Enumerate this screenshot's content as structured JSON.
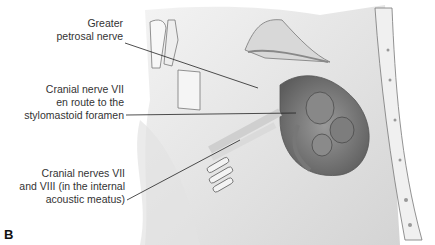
{
  "figure": {
    "panel_label": "B",
    "labels": [
      {
        "id": "greater-petrosal",
        "lines": [
          "Greater",
          "petrosal nerve"
        ]
      },
      {
        "id": "cn7-stylomastoid",
        "lines": [
          "Cranial nerve VII",
          "en route to the",
          "stylomastoid foramen"
        ]
      },
      {
        "id": "cn7-8-meatus",
        "lines": [
          "Cranial nerves VII",
          "and VIII (in the internal",
          "acoustic meatus)"
        ]
      }
    ]
  }
}
